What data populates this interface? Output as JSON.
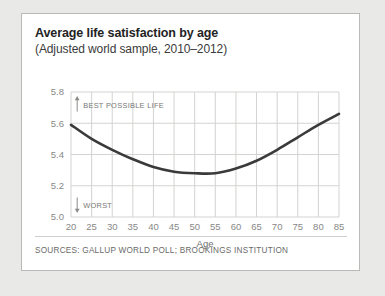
{
  "card": {
    "title": "Average life satisfaction by age",
    "subtitle": "(Adjusted world sample, 2010–2012)",
    "sources": "SOURCES: GALLUP WORLD POLL; BROOKINGS INSTITUTION"
  },
  "chart_data": {
    "type": "line",
    "title": "Average life satisfaction by age",
    "subtitle": "(Adjusted world sample, 2010–2012)",
    "xlabel": "Age",
    "ylabel": "",
    "xlim": [
      20,
      85
    ],
    "ylim": [
      5.0,
      5.8
    ],
    "grid": true,
    "legend": "none",
    "x": [
      20,
      25,
      30,
      35,
      40,
      45,
      50,
      55,
      60,
      65,
      70,
      75,
      80,
      85
    ],
    "xticks": [
      "20",
      "25",
      "30",
      "35",
      "40",
      "45",
      "50",
      "55",
      "60",
      "65",
      "70",
      "75",
      "80",
      "85"
    ],
    "yticks": [
      "5.0",
      "5.2",
      "5.4",
      "5.6",
      "5.8"
    ],
    "series": [
      {
        "name": "Average life satisfaction",
        "color": "#3a3a3a",
        "values": [
          5.59,
          5.5,
          5.43,
          5.37,
          5.32,
          5.29,
          5.28,
          5.28,
          5.31,
          5.36,
          5.43,
          5.51,
          5.59,
          5.66
        ]
      }
    ],
    "annotations": [
      {
        "text": "BEST POSSIBLE LIFE",
        "arrow": "up",
        "x": 21.5,
        "y": 5.72
      },
      {
        "text": "WORST",
        "arrow": "down",
        "x": 21.5,
        "y": 5.08
      }
    ]
  }
}
